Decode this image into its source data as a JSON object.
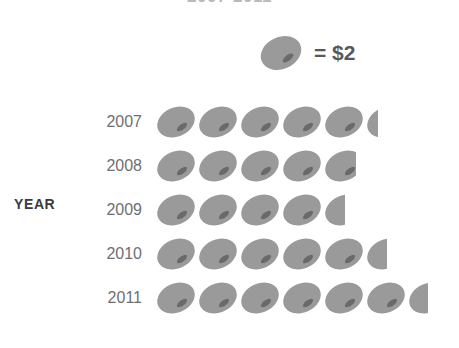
{
  "title": "2007-2011",
  "axis": {
    "y_label": "YEAR"
  },
  "key": {
    "icon": "coin-icon",
    "equals_text": "= $2",
    "unit_value": 2,
    "currency": "$"
  },
  "colors": {
    "coin": "#9a9a9a",
    "coin_shade": "#8c8c8c",
    "coin_slit": "#6a6a6a",
    "year_label": "#6f6f72",
    "axis_label": "#3b3b3d",
    "key_text": "#58585b",
    "background": "#ffffff"
  },
  "rows": [
    {
      "label": "2007",
      "full_icons": 5,
      "partial_fraction": 0.3,
      "value": 10.6
    },
    {
      "label": "2008",
      "full_icons": 4,
      "partial_fraction": 0.78,
      "value": 9.5
    },
    {
      "label": "2009",
      "full_icons": 4,
      "partial_fraction": 0.52,
      "value": 9.0
    },
    {
      "label": "2010",
      "full_icons": 5,
      "partial_fraction": 0.52,
      "value": 11.0
    },
    {
      "label": "2011",
      "full_icons": 6,
      "partial_fraction": 0.5,
      "value": 13.0
    }
  ],
  "chart_data": {
    "type": "bar",
    "subtype": "pictograph",
    "title": "2007-2011",
    "xlabel": "",
    "ylabel": "YEAR",
    "categories": [
      "2007",
      "2008",
      "2009",
      "2010",
      "2011"
    ],
    "values": [
      10.6,
      9.5,
      9.0,
      11.0,
      13.0
    ],
    "icon_counts": [
      5.3,
      4.75,
      4.5,
      5.5,
      6.5
    ],
    "icon_unit_value": 2,
    "icon_name": "coin-icon",
    "legend": "= $2",
    "legend_position": "top",
    "grid": false,
    "orientation": "horizontal",
    "xlim": [
      0,
      14
    ],
    "units": "dollars"
  }
}
